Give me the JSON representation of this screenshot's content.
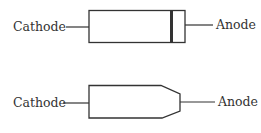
{
  "diagrams": [
    {
      "name": "diode-with-band",
      "left_label": "Cathode",
      "right_label": "Anode"
    },
    {
      "name": "diode-tapered",
      "left_label": "Cathode",
      "right_label": "Anode"
    }
  ],
  "colors": {
    "stroke": "#333333",
    "text": "#333333",
    "band": "#333333"
  }
}
